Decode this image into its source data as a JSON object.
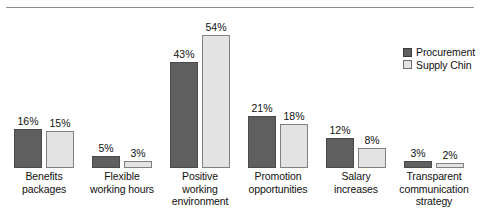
{
  "chart_data": {
    "type": "bar",
    "title": "",
    "subtitle": "",
    "xlabel": "",
    "ylabel": "",
    "ylim": [
      0,
      54
    ],
    "grid": false,
    "legend_position": "top-right",
    "value_suffix": "%",
    "categories": [
      "Benefits packages",
      "Flexible working hours",
      "Positive working environment",
      "Promotion opportunities",
      "Salary increases",
      "Transparent communication strategy"
    ],
    "series": [
      {
        "name": "Procurement",
        "color": "#5f5f5f",
        "values": [
          16,
          5,
          43,
          21,
          12,
          3
        ],
        "labels": [
          "16%",
          "5%",
          "43%",
          "21%",
          "12%",
          "3%"
        ]
      },
      {
        "name": "Supply Chin",
        "color": "#e3e3e3",
        "values": [
          15,
          3,
          54,
          18,
          8,
          2
        ],
        "labels": [
          "15%",
          "3%",
          "54%",
          "18%",
          "8%",
          "2%"
        ]
      }
    ]
  },
  "legend": {
    "items": [
      {
        "label": "Procurement",
        "swatch": "dark"
      },
      {
        "label": "Supply Chin",
        "swatch": "light"
      }
    ]
  },
  "axis": {
    "category_lines": [
      [
        "Benefits",
        "packages"
      ],
      [
        "Flexible",
        "working hours"
      ],
      [
        "Positive",
        "working",
        "environment"
      ],
      [
        "Promotion",
        "opportunities"
      ],
      [
        "Salary",
        "increases"
      ],
      [
        "Transparent",
        "communication",
        "strategy"
      ]
    ]
  },
  "colors": {
    "series_dark": "#5f5f5f",
    "series_light": "#e3e3e3",
    "rule": "#8d8d8d",
    "text": "#111111"
  }
}
